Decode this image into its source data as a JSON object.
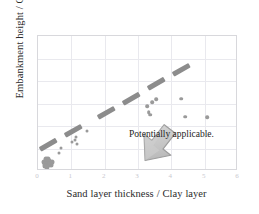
{
  "chart_data": {
    "type": "scatter",
    "title": "",
    "xlabel": "Sand layer thickness / Clay layer",
    "xlabel_words": [
      "Sand",
      "layer",
      "thickness",
      "/",
      "Clay",
      "layer"
    ],
    "ylabel": "Embankment height / Clay layer thickness",
    "xlim": [
      0,
      6
    ],
    "ylim": [
      0,
      6
    ],
    "xticks": [
      "0",
      "1",
      "2",
      "3",
      "4",
      "5",
      "6"
    ],
    "yticks": [],
    "grid": true,
    "legend": null,
    "annotations": [
      {
        "text": "Potentially applicable.",
        "x": 3.0,
        "y": 1.05,
        "kind": "text-label"
      },
      {
        "text": "",
        "kind": "block-arrow",
        "x": 2.3,
        "y": 2.6,
        "direction": "down-right",
        "color": "#bdbdbd"
      }
    ],
    "series": [
      {
        "name": "Case data",
        "marker": "circle",
        "color": "#9a9a9a",
        "points": [
          [
            0.18,
            0.42
          ],
          [
            0.22,
            0.3
          ],
          [
            0.27,
            0.38
          ],
          [
            0.3,
            0.25
          ],
          [
            0.33,
            0.45
          ],
          [
            0.36,
            0.33
          ],
          [
            0.24,
            0.52
          ],
          [
            0.4,
            0.28
          ],
          [
            0.2,
            0.22
          ],
          [
            0.31,
            0.55
          ],
          [
            0.43,
            0.4
          ],
          [
            0.26,
            0.18
          ],
          [
            0.62,
            0.78
          ],
          [
            0.7,
            1.02
          ],
          [
            1.02,
            1.28
          ],
          [
            1.12,
            1.4
          ],
          [
            1.14,
            1.52
          ],
          [
            1.18,
            1.22
          ],
          [
            1.48,
            1.78
          ],
          [
            3.28,
            2.88
          ],
          [
            3.32,
            2.62
          ],
          [
            3.36,
            2.5
          ],
          [
            3.42,
            3.05
          ],
          [
            3.55,
            3.18
          ],
          [
            4.3,
            3.22
          ],
          [
            4.42,
            2.42
          ],
          [
            5.08,
            2.4
          ]
        ]
      }
    ],
    "trend_band": {
      "name": "Applicability boundary (dashed band)",
      "style": "thick-dashed",
      "color": "#8c8c8c",
      "segments": [
        {
          "x1": 0.05,
          "y1": 0.95,
          "x2": 0.55,
          "y2": 1.38
        },
        {
          "x1": 0.8,
          "y1": 1.58,
          "x2": 1.3,
          "y2": 2.0
        },
        {
          "x1": 1.8,
          "y1": 2.4,
          "x2": 2.3,
          "y2": 2.82
        },
        {
          "x1": 2.55,
          "y1": 3.02,
          "x2": 3.05,
          "y2": 3.45
        },
        {
          "x1": 3.3,
          "y1": 3.65,
          "x2": 3.8,
          "y2": 4.08
        },
        {
          "x1": 4.05,
          "y1": 4.28,
          "x2": 4.55,
          "y2": 4.7
        }
      ]
    }
  },
  "colors": {
    "marker": "#9a9a9a",
    "band": "#8c8c8c",
    "arrow": "#bdbdbd",
    "grid": "#e9e9ee",
    "frame": "#d8d8dc",
    "text": "#2b2b2b",
    "tick": "#c9c9cf",
    "background": "#ffffff"
  }
}
